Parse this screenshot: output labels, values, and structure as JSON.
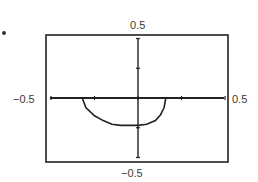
{
  "chart_data": {
    "type": "line",
    "title": "",
    "xlabel": "",
    "ylabel": "",
    "xlim": [
      -0.5,
      0.5
    ],
    "ylim": [
      -0.5,
      0.5
    ],
    "grid": false,
    "legend": null,
    "tick_labels": {
      "top": "0.5",
      "bottom": "−0.5",
      "left": "−0.5",
      "right": "0.5"
    },
    "x_ticks": [
      -0.5,
      -0.25,
      0,
      0.25,
      0.5
    ],
    "y_ticks": [
      -0.5,
      -0.25,
      0,
      0.25,
      0.5
    ],
    "series": [
      {
        "name": "curve",
        "description": "lower semicircle-like arc below the x-axis",
        "x": [
          -0.32,
          -0.3,
          -0.25,
          -0.2,
          -0.15,
          -0.1,
          -0.05,
          0.0,
          0.05,
          0.1,
          0.13,
          0.15,
          0.16
        ],
        "y": [
          0.0,
          -0.08,
          -0.15,
          -0.19,
          -0.22,
          -0.23,
          -0.23,
          -0.23,
          -0.22,
          -0.19,
          -0.14,
          -0.08,
          0.0
        ]
      }
    ]
  },
  "labels": {
    "top": "0.5",
    "bottom": "−0.5",
    "left": "−0.5",
    "right": "0.5"
  }
}
